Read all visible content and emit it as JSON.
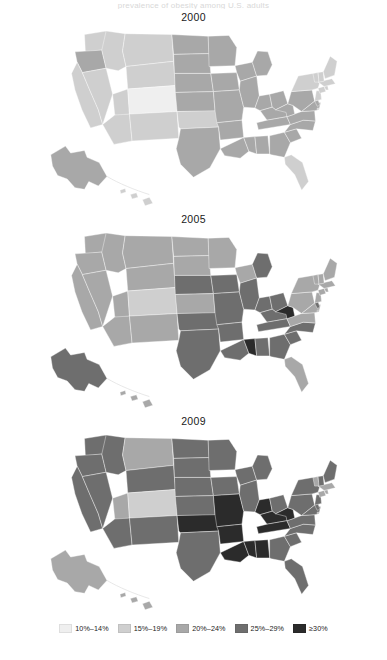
{
  "figure": {
    "clipped_top_caption": "prevalence of obesity among U.S. adults",
    "panels": [
      {
        "title": "2000"
      },
      {
        "title": "2005"
      },
      {
        "title": "2009"
      }
    ]
  },
  "legend": {
    "items": [
      {
        "label": "10%–14%",
        "color": "#efefef"
      },
      {
        "label": "15%–19%",
        "color": "#cfcfcf"
      },
      {
        "label": "20%–24%",
        "color": "#a8a8a8"
      },
      {
        "label": "25%–29%",
        "color": "#6e6e6e"
      },
      {
        "label": "≥30%",
        "color": "#2b2b2b"
      }
    ]
  },
  "chart_data": {
    "type": "heatmap",
    "title": "prevalence of obesity among U.S. adults",
    "xlabel": "",
    "ylabel": "",
    "grid": false,
    "legend_position": "bottom",
    "subtype": "choropleth-map-small-multiples",
    "class_breaks": [
      "10%–14%",
      "15%–19%",
      "20%–24%",
      "25%–29%",
      "≥30%"
    ],
    "class_colors": [
      "#efefef",
      "#cfcfcf",
      "#a8a8a8",
      "#6e6e6e",
      "#2b2b2b"
    ],
    "panels": [
      "2000",
      "2005",
      "2009"
    ],
    "series": [
      {
        "name": "2000",
        "values": {
          "AL": 2,
          "AK": 2,
          "AZ": 1,
          "AR": 2,
          "CA": 1,
          "CO": 0,
          "CT": 1,
          "DE": 2,
          "FL": 1,
          "GA": 2,
          "HI": 1,
          "ID": 1,
          "IL": 2,
          "IN": 2,
          "IA": 2,
          "KS": 2,
          "KY": 2,
          "LA": 2,
          "ME": 1,
          "MD": 2,
          "MA": 1,
          "MI": 2,
          "MN": 2,
          "MS": 2,
          "MO": 2,
          "MT": 1,
          "NE": 2,
          "NV": 1,
          "NH": 1,
          "NJ": 1,
          "NM": 1,
          "NY": 1,
          "NC": 2,
          "ND": 2,
          "OH": 2,
          "OK": 1,
          "OR": 2,
          "PA": 2,
          "RI": 1,
          "SC": 2,
          "SD": 2,
          "TN": 2,
          "TX": 2,
          "UT": 1,
          "VT": 1,
          "VA": 2,
          "WA": 1,
          "WV": 2,
          "WI": 2,
          "WY": 1,
          "DC": 1
        }
      },
      {
        "name": "2005",
        "values": {
          "AL": 3,
          "AK": 3,
          "AZ": 2,
          "AR": 3,
          "CA": 2,
          "CO": 1,
          "CT": 2,
          "DE": 3,
          "FL": 2,
          "GA": 3,
          "HI": 2,
          "ID": 2,
          "IL": 3,
          "IN": 3,
          "IA": 3,
          "KS": 2,
          "KY": 3,
          "LA": 3,
          "ME": 2,
          "MD": 2,
          "MA": 2,
          "MI": 3,
          "MN": 2,
          "MS": 4,
          "MO": 3,
          "MT": 2,
          "NE": 3,
          "NV": 2,
          "NH": 2,
          "NJ": 2,
          "NM": 2,
          "NY": 2,
          "NC": 3,
          "ND": 2,
          "OH": 3,
          "OK": 3,
          "OR": 2,
          "PA": 2,
          "RI": 2,
          "SC": 3,
          "SD": 2,
          "TN": 3,
          "TX": 3,
          "UT": 2,
          "VT": 2,
          "VA": 2,
          "WA": 2,
          "WV": 4,
          "WI": 2,
          "WY": 2,
          "DC": 2
        }
      },
      {
        "name": "2009",
        "values": {
          "AL": 4,
          "AK": 2,
          "AZ": 3,
          "AR": 4,
          "CA": 3,
          "CO": 1,
          "CT": 2,
          "DE": 3,
          "FL": 3,
          "GA": 3,
          "HI": 2,
          "ID": 3,
          "IN": 4,
          "IL": 3,
          "IA": 3,
          "KS": 3,
          "KY": 4,
          "LA": 4,
          "ME": 3,
          "MD": 3,
          "MA": 2,
          "MI": 3,
          "MN": 3,
          "MS": 4,
          "MO": 4,
          "MT": 2,
          "NE": 3,
          "NV": 3,
          "NH": 3,
          "NJ": 3,
          "NM": 3,
          "NY": 3,
          "NC": 3,
          "ND": 3,
          "OH": 3,
          "OK": 4,
          "OR": 3,
          "PA": 3,
          "RI": 2,
          "SC": 3,
          "SD": 3,
          "TN": 4,
          "TX": 3,
          "UT": 2,
          "VT": 2,
          "VA": 3,
          "WA": 3,
          "WV": 4,
          "WI": 3,
          "WY": 3,
          "DC": 2
        }
      }
    ]
  }
}
